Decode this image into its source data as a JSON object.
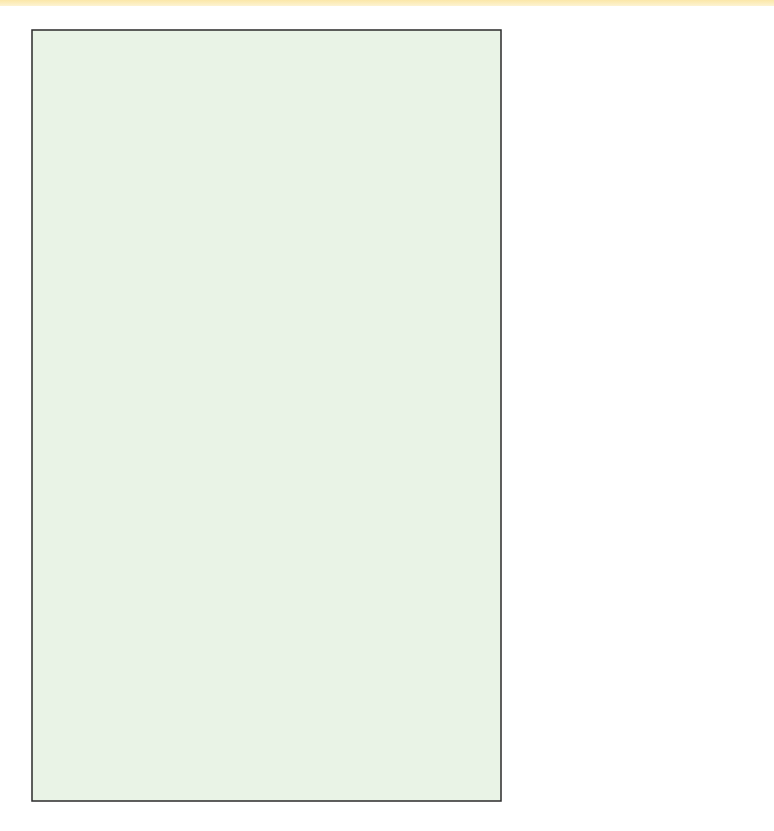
{
  "colors": {
    "panel_bg": "#e9f3e6",
    "frame": "#2b2b2b",
    "line": "#1f1f1f",
    "arrow": "#7f93c0",
    "top_band": "#fbe7a8"
  },
  "annotations": {
    "start_d": "Start production of D",
    "must_have": [
      "Must have D and E",
      "completed here so",
      "production can",
      "begin on B"
    ],
    "two_weeks_to": "2 weeks to",
    "produce": "produce"
  },
  "bars": [
    {
      "id": "bar-d-top",
      "label": "D",
      "from": 4,
      "to": 5,
      "duration": "1 week"
    },
    {
      "id": "bar-e-top",
      "label": "E",
      "from": 3,
      "to": 5,
      "duration": "2 weeks"
    },
    {
      "id": "bar-b",
      "label": "B",
      "from": 5,
      "to": 7,
      "duration": "2 weeks to produce"
    },
    {
      "id": "bar-a",
      "label": "A",
      "from": 7,
      "to": 8,
      "duration": "1 week"
    },
    {
      "id": "bar-e-mid",
      "label": "E",
      "from": 4,
      "to": 6,
      "duration": "2 weeks"
    },
    {
      "id": "bar-c",
      "label": "C",
      "from": 6,
      "to": 7,
      "duration": "1 week"
    },
    {
      "id": "bar-g",
      "label": "G",
      "from": 1,
      "to": 3,
      "duration": "2 weeks"
    },
    {
      "id": "bar-f",
      "label": "F",
      "from": 3,
      "to": 6,
      "duration": "3 weeks"
    },
    {
      "id": "bar-d-low",
      "label": "D",
      "from": 2,
      "to": 3,
      "duration": "1 week"
    }
  ],
  "axis": {
    "ticks": [
      "1",
      "2",
      "3",
      "4",
      "5",
      "6",
      "7",
      "8"
    ],
    "title": "Time in weeks"
  },
  "text": {
    "d_top_dur": "1 week",
    "d_top_lbl": "D",
    "e_top_dur": "2 weeks",
    "e_top_lbl": "E",
    "b_lbl": "B",
    "a_lbl": "A",
    "a_dur": "1 week",
    "e_mid_dur": "2 weeks",
    "e_mid_lbl": "E",
    "c_dur": "1 week",
    "c_lbl": "C",
    "g_dur": "2 weeks",
    "g_lbl": "G",
    "f_dur": "3 weeks",
    "f_lbl": "F",
    "d_low_dur": "1 week",
    "d_low_lbl": "D"
  }
}
